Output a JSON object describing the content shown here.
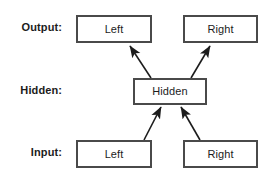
{
  "diagram": {
    "background_color": "#ffffff",
    "box_border_color": "#4a4a4a",
    "text_color": "#1c1c1c",
    "arrow_color": "#1c1c1c",
    "rows": [
      {
        "id": "output",
        "label": "Output:",
        "label_x": 15,
        "label_y": 22,
        "label_width": 47,
        "nodes": [
          {
            "id": "output-left",
            "label": "Left",
            "x": 76,
            "y": 15,
            "width": 76,
            "height": 28
          },
          {
            "id": "output-right",
            "label": "Right",
            "x": 183,
            "y": 15,
            "width": 75,
            "height": 28
          }
        ]
      },
      {
        "id": "hidden",
        "label": "Hidden:",
        "label_x": 15,
        "label_y": 85,
        "label_width": 47,
        "nodes": [
          {
            "id": "hidden-node",
            "label": "Hidden",
            "x": 133,
            "y": 78,
            "width": 74,
            "height": 27
          }
        ]
      },
      {
        "id": "input",
        "label": "Input:",
        "label_x": 15,
        "label_y": 147,
        "label_width": 47,
        "nodes": [
          {
            "id": "input-left",
            "label": "Left",
            "x": 76,
            "y": 140,
            "width": 76,
            "height": 28
          },
          {
            "id": "input-right",
            "label": "Right",
            "x": 183,
            "y": 140,
            "width": 75,
            "height": 28
          }
        ]
      }
    ],
    "edges": [
      {
        "id": "hidden-to-output-left",
        "from": "hidden-node",
        "to": "output-left",
        "x1": 151,
        "y1": 78,
        "x2": 130,
        "y2": 46
      },
      {
        "id": "hidden-to-output-right",
        "from": "hidden-node",
        "to": "output-right",
        "x1": 191,
        "y1": 78,
        "x2": 210,
        "y2": 46
      },
      {
        "id": "input-left-to-hidden",
        "from": "input-left",
        "to": "hidden-node",
        "x1": 144,
        "y1": 140,
        "x2": 161,
        "y2": 107
      },
      {
        "id": "input-right-to-hidden",
        "from": "input-right",
        "to": "hidden-node",
        "x1": 200,
        "y1": 140,
        "x2": 181,
        "y2": 107
      }
    ]
  }
}
